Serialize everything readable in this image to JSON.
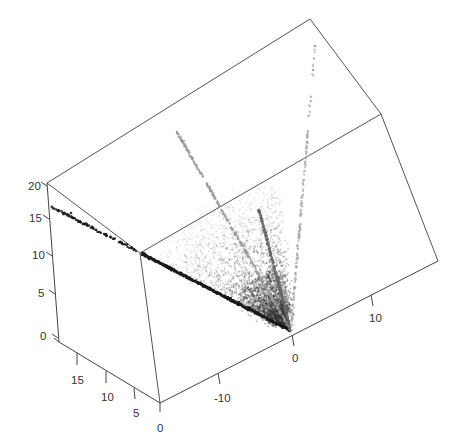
{
  "chart_data": {
    "type": "scatter3d",
    "title": "",
    "xlabel": "",
    "ylabel": "",
    "zlabel": "",
    "axes": {
      "z": {
        "ticks": [
          0,
          5,
          10,
          15,
          20
        ],
        "range": [
          0,
          20
        ]
      },
      "depth": {
        "ticks": [
          0,
          5,
          10,
          15
        ],
        "range": [
          0,
          20
        ]
      },
      "front": {
        "ticks": [
          -10,
          0,
          10
        ],
        "range": [
          -18,
          20
        ]
      }
    },
    "grid": false,
    "legend": null,
    "rays": [
      {
        "name": "dark-diagonal",
        "from_px": [
          291,
          331
        ],
        "to_px": [
          52,
          207
        ],
        "color": "#1a1a1a",
        "density": "high"
      },
      {
        "name": "long-left-light",
        "from_px": [
          291,
          331
        ],
        "to_px": [
          177,
          132
        ],
        "color": "#9a9a9a",
        "density": "medium"
      },
      {
        "name": "short-dark",
        "from_px": [
          291,
          331
        ],
        "to_px": [
          259,
          210
        ],
        "color": "#6a6a6a",
        "density": "medium"
      },
      {
        "name": "long-top-faint",
        "from_px": [
          291,
          331
        ],
        "to_px": [
          315,
          46
        ],
        "color": "#a8a8a8",
        "density": "low"
      }
    ],
    "cloud": {
      "center_px": [
        270,
        300
      ],
      "spread": "fan between dark-diagonal and long-top-faint rays",
      "color": "#555555"
    }
  },
  "labels": {
    "z": [
      "20",
      "15",
      "10",
      "5",
      "0"
    ],
    "depth": [
      "15",
      "10",
      "5",
      "0"
    ],
    "front": [
      "-10",
      "0",
      "10"
    ]
  },
  "colors": {
    "box": "#555555",
    "axis": "#444444",
    "text": "#333333",
    "background": "#ffffff"
  }
}
